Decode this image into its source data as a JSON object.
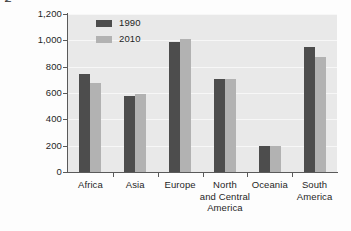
{
  "chart_data": {
    "type": "bar",
    "title": "",
    "xlabel": "",
    "ylabel": "Million hectares of forest",
    "categories": [
      "Africa",
      "Asia",
      "Europe",
      "North\nand Central\nAmerica",
      "Oceania",
      "South\nAmerica"
    ],
    "category_lines": [
      [
        "Africa"
      ],
      [
        "Asia"
      ],
      [
        "Europe"
      ],
      [
        "North",
        "and Central",
        "America"
      ],
      [
        "Oceania"
      ],
      [
        "South",
        "America"
      ]
    ],
    "series": [
      {
        "name": "1990",
        "color": "#4d4d4d",
        "values": [
          745,
          580,
          990,
          710,
          200,
          950
        ]
      },
      {
        "name": "2010",
        "color": "#b2b2b2",
        "values": [
          675,
          590,
          1010,
          710,
          198,
          875
        ]
      }
    ],
    "ylim": [
      0,
      1200
    ],
    "yticks": [
      0,
      200,
      400,
      600,
      800,
      1000,
      1200
    ],
    "ytick_labels": [
      "0",
      "200",
      "400",
      "600",
      "800",
      "1,000",
      "1,200"
    ],
    "grid": true,
    "legend_position": "top-left-inside"
  },
  "legend": {
    "entries": [
      {
        "label": "1990",
        "color": "#4d4d4d"
      },
      {
        "label": "2010",
        "color": "#b2b2b2"
      }
    ]
  },
  "colors": {
    "plot_background": "#e9e9e9",
    "gridline": "#f7f7f7",
    "axis": "#5a5a5a",
    "series_1990": "#4d4d4d",
    "series_2010": "#b2b2b2",
    "text": "#1f1f1f"
  }
}
